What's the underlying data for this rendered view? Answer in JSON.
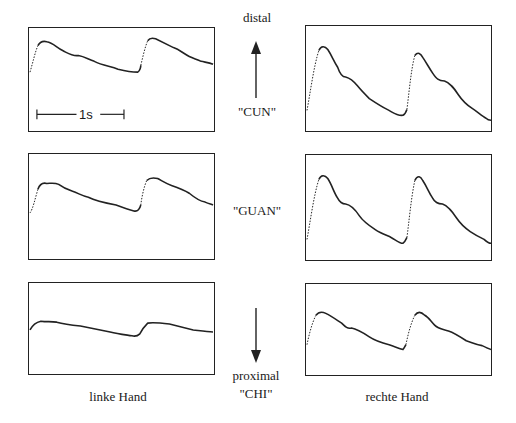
{
  "figure": {
    "labels": {
      "distal": "distal",
      "cun": "\"CUN\"",
      "guan": "\"GUAN\"",
      "proximal": "proximal",
      "chi": "\"CHI\"",
      "left_hand": "linke Hand",
      "right_hand": "rechte Hand",
      "scale_bar": "1s"
    },
    "arrows": [
      {
        "name": "distal-arrow",
        "direction": "up"
      },
      {
        "name": "proximal-arrow",
        "direction": "down"
      }
    ],
    "panels": [
      {
        "id": "left-cun",
        "hand": "linke Hand",
        "position": "CUN"
      },
      {
        "id": "right-cun",
        "hand": "rechte Hand",
        "position": "CUN"
      },
      {
        "id": "left-guan",
        "hand": "linke Hand",
        "position": "GUAN"
      },
      {
        "id": "right-guan",
        "hand": "rechte Hand",
        "position": "GUAN"
      },
      {
        "id": "left-chi",
        "hand": "linke Hand",
        "position": "CHI"
      },
      {
        "id": "right-chi",
        "hand": "rechte Hand",
        "position": "CHI"
      }
    ]
  }
}
